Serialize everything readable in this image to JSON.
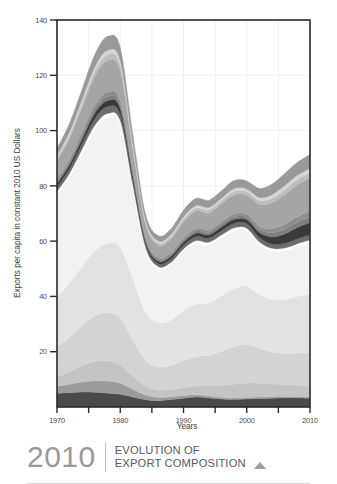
{
  "figure": {
    "background": "#ffffff",
    "frame_color": "#2b2b2b",
    "grid_color": "#f0f0f0"
  },
  "caption": {
    "year": "2010",
    "title_line1": "EVOLUTION OF",
    "title_line2": "EXPORT COMPOSITION",
    "marker_icon": "triangle-up-icon",
    "year_color": "#9a9a9a",
    "title_color": "#5a5a5a",
    "marker_color": "#9d9d9d"
  },
  "chart_data": {
    "type": "area",
    "stacked": true,
    "title": "",
    "subtitle": "",
    "xlabel": "Years",
    "ylabel": "Exports per capita in constant 2010 US Dollars",
    "xlim": [
      1970,
      2010
    ],
    "ylim": [
      0,
      140
    ],
    "grid": true,
    "legend_position": "none",
    "x_major_ticks": [
      1970,
      1980,
      1990,
      2000,
      2010
    ],
    "x_major_labels": [
      "1970",
      "1980",
      "1990",
      "2000",
      "2010"
    ],
    "x_minor_ticks": [
      1975,
      1985,
      1995,
      2005
    ],
    "y_ticks": [
      20,
      40,
      60,
      80,
      100,
      120,
      140
    ],
    "y_tick_labels": [
      "20",
      "40",
      "60",
      "80",
      "100",
      "120",
      "140"
    ],
    "x": [
      1970,
      1972,
      1974,
      1976,
      1978,
      1980,
      1982,
      1984,
      1986,
      1988,
      1990,
      1992,
      1994,
      1996,
      1998,
      2000,
      2002,
      2004,
      2006,
      2008,
      2010
    ],
    "series": [
      {
        "name": "Layer 01",
        "color": "#4a4a4a",
        "values": [
          5.0,
          5.2,
          5.4,
          5.3,
          5.0,
          4.6,
          3.6,
          2.6,
          2.3,
          2.7,
          3.2,
          3.6,
          3.3,
          2.9,
          2.7,
          2.9,
          3.1,
          3.2,
          3.3,
          3.3,
          3.2
        ]
      },
      {
        "name": "Layer 02",
        "color": "#9b9b9b",
        "values": [
          2.4,
          3.0,
          3.6,
          4.2,
          4.4,
          4.0,
          2.8,
          1.7,
          1.2,
          1.0,
          0.9,
          0.8,
          0.7,
          0.6,
          0.6,
          0.5,
          0.5,
          0.5,
          0.5,
          0.5,
          0.5
        ]
      },
      {
        "name": "Layer 03",
        "color": "#c4c4c4",
        "values": [
          3.4,
          4.6,
          6.0,
          7.0,
          7.3,
          6.6,
          4.8,
          3.2,
          2.6,
          2.6,
          2.9,
          3.2,
          3.6,
          4.3,
          4.9,
          5.3,
          5.0,
          4.6,
          4.3,
          4.1,
          4.0
        ]
      },
      {
        "name": "Layer 04",
        "color": "#d3d3d3",
        "values": [
          11.0,
          12.5,
          14.5,
          16.5,
          17.5,
          17.0,
          13.0,
          9.4,
          8.4,
          8.7,
          9.8,
          10.6,
          11.0,
          12.4,
          13.6,
          14.0,
          12.6,
          11.6,
          11.3,
          11.6,
          12.0
        ]
      },
      {
        "name": "Layer 05",
        "color": "#e2e2e2",
        "values": [
          18.0,
          19.5,
          21.5,
          23.5,
          25.0,
          25.5,
          22.0,
          17.5,
          16.0,
          16.5,
          18.0,
          19.0,
          19.0,
          20.0,
          21.0,
          21.0,
          19.5,
          19.0,
          19.5,
          20.5,
          21.0
        ]
      },
      {
        "name": "Layer 06",
        "color": "#f2f2f2",
        "values": [
          37.0,
          38.5,
          41.0,
          44.0,
          45.5,
          44.5,
          33.0,
          22.5,
          19.5,
          20.0,
          21.5,
          22.0,
          21.0,
          21.0,
          21.0,
          20.0,
          18.0,
          17.5,
          17.5,
          18.0,
          18.5
        ]
      },
      {
        "name": "Layer 07",
        "color": "#ffffff",
        "values": [
          1.2,
          1.3,
          1.4,
          1.5,
          1.5,
          1.4,
          1.1,
          0.9,
          0.8,
          0.8,
          0.9,
          1.0,
          1.0,
          1.0,
          1.0,
          1.0,
          1.0,
          1.0,
          1.1,
          1.1,
          1.2
        ]
      },
      {
        "name": "Layer 08",
        "color": "#6d6d6d",
        "values": [
          1.6,
          1.8,
          2.1,
          2.4,
          2.5,
          2.3,
          1.7,
          1.2,
          1.1,
          1.2,
          1.4,
          1.5,
          1.5,
          1.6,
          1.7,
          1.7,
          1.6,
          1.6,
          1.7,
          1.8,
          1.9
        ]
      },
      {
        "name": "Layer 09",
        "color": "#3a3a3a",
        "values": [
          1.2,
          1.4,
          1.7,
          2.0,
          2.2,
          2.1,
          1.5,
          1.0,
          0.9,
          1.0,
          1.1,
          1.2,
          1.2,
          1.3,
          1.4,
          1.4,
          1.8,
          2.6,
          3.4,
          4.0,
          4.4
        ]
      },
      {
        "name": "Layer 10",
        "color": "#7f7f7f",
        "values": [
          0.8,
          0.9,
          1.1,
          1.3,
          1.4,
          1.3,
          0.9,
          0.6,
          0.6,
          0.6,
          0.7,
          0.8,
          0.8,
          0.9,
          0.9,
          0.9,
          1.1,
          1.4,
          1.7,
          1.9,
          2.0
        ]
      },
      {
        "name": "Layer 11",
        "color": "#8e8e8e",
        "values": [
          0.9,
          1.1,
          1.3,
          1.5,
          1.6,
          1.5,
          1.0,
          0.7,
          0.6,
          0.7,
          0.8,
          0.9,
          0.9,
          0.9,
          1.0,
          1.0,
          1.2,
          1.5,
          1.8,
          2.0,
          2.1
        ]
      },
      {
        "name": "Layer 12",
        "color": "#a5a5a5",
        "values": [
          6.5,
          7.5,
          9.0,
          10.5,
          11.5,
          11.0,
          7.5,
          5.0,
          4.6,
          5.0,
          5.8,
          6.3,
          6.2,
          6.6,
          7.0,
          7.0,
          8.0,
          9.5,
          10.8,
          11.6,
          12.0
        ]
      },
      {
        "name": "Layer 13",
        "color": "#bdbdbd",
        "values": [
          1.0,
          1.2,
          1.5,
          1.8,
          2.0,
          1.9,
          1.3,
          0.8,
          0.8,
          0.8,
          1.0,
          1.1,
          1.1,
          1.1,
          1.2,
          1.2,
          1.3,
          1.5,
          1.7,
          1.8,
          1.9
        ]
      },
      {
        "name": "Layer 14",
        "color": "#d5d5d5",
        "values": [
          0.9,
          1.1,
          1.3,
          1.6,
          1.7,
          1.6,
          1.1,
          0.7,
          0.7,
          0.7,
          0.8,
          0.9,
          0.9,
          0.9,
          1.0,
          1.0,
          1.1,
          1.3,
          1.5,
          1.6,
          1.7
        ]
      },
      {
        "name": "Layer 15",
        "color": "#999999",
        "values": [
          2.6,
          3.1,
          3.8,
          4.5,
          5.0,
          4.8,
          3.2,
          2.1,
          1.9,
          2.1,
          2.4,
          2.6,
          2.6,
          2.7,
          2.9,
          2.9,
          3.3,
          3.9,
          4.4,
          4.7,
          4.9
        ]
      }
    ],
    "totals_note": "Stacked total peaks near 141 at 1980 and falls to about 58 in 1986."
  }
}
